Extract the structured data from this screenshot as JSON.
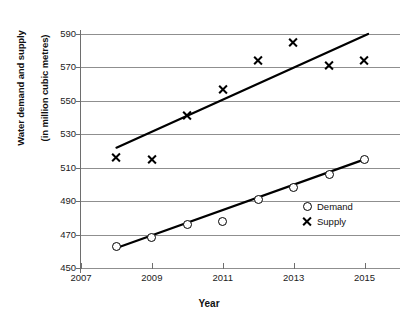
{
  "chart_data": {
    "type": "scatter",
    "title": "",
    "xlabel": "Year",
    "ylabel": "Water demand and supply\n(in million cubic metres)",
    "x": [
      2008,
      2009,
      2010,
      2011,
      2012,
      2013,
      2014,
      2015
    ],
    "xlim": [
      2007,
      2016
    ],
    "ylim": [
      450,
      590
    ],
    "xticks": [
      2007,
      2009,
      2011,
      2013,
      2015
    ],
    "yticks": [
      450,
      470,
      490,
      510,
      530,
      550,
      570,
      590
    ],
    "grid": true,
    "legend_position": "center right",
    "series": [
      {
        "name": "Demand",
        "marker": "open-circle",
        "values": [
          463,
          468,
          476,
          478,
          491,
          498,
          506,
          515
        ],
        "trendline": {
          "x0": 2008,
          "y0": 462,
          "x1": 2015,
          "y1": 515
        }
      },
      {
        "name": "Supply",
        "marker": "x",
        "values": [
          516,
          515,
          541,
          557,
          574,
          585,
          571,
          574
        ],
        "trendline": {
          "x0": 2008,
          "y0": 522,
          "x1": 2015.1,
          "y1": 590
        }
      }
    ],
    "colors": {
      "series": "#000000",
      "grid": "#8f8f8f",
      "axis": "#6e6e6e",
      "text": "#111111"
    }
  },
  "axes": {
    "y_title_line1": "Water demand and supply",
    "y_title_line2": "(in million cubic metres)",
    "x_title": "Year",
    "ytick_labels": [
      "590",
      "570",
      "550",
      "530",
      "510",
      "490",
      "470",
      "450"
    ],
    "xtick_labels": [
      "2007",
      "2009",
      "2011",
      "2013",
      "2015"
    ]
  },
  "legend": {
    "items": [
      {
        "label": "Demand",
        "marker": "open-circle"
      },
      {
        "label": "Supply",
        "marker": "x"
      }
    ]
  }
}
